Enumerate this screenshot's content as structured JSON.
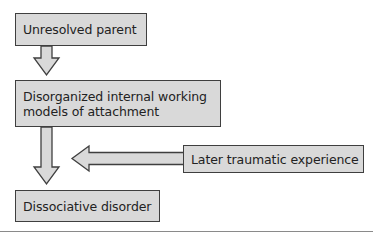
{
  "diagram": {
    "nodes": [
      {
        "id": "unresolved-parent",
        "label": "Unresolved parent"
      },
      {
        "id": "disorganized-iwm",
        "lines": [
          "Disorganized internal working",
          "models of attachment"
        ]
      },
      {
        "id": "later-trauma",
        "label": "Later traumatic experience"
      },
      {
        "id": "dissociative-disorder",
        "label": "Dissociative disorder"
      }
    ],
    "edges": [
      {
        "from": "unresolved-parent",
        "to": "disorganized-iwm",
        "direction": "down"
      },
      {
        "from": "disorganized-iwm",
        "to": "dissociative-disorder",
        "direction": "down"
      },
      {
        "from": "later-trauma",
        "to": "disorganized-iwm-to-dissociative-edge",
        "direction": "left"
      }
    ],
    "colors": {
      "box_fill": "#d9d9d9",
      "box_border": "#3f3f3f",
      "text": "#222222",
      "rule": "#8a8a8a"
    }
  }
}
